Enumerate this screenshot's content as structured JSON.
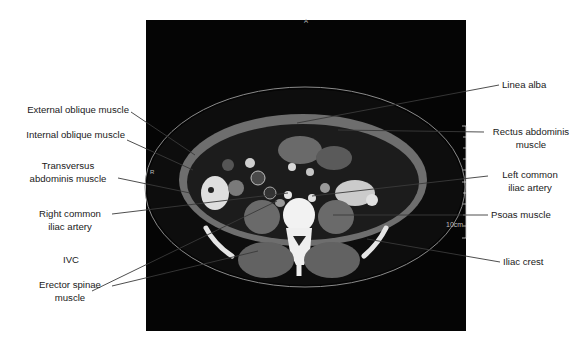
{
  "figure": {
    "type": "axial CT slice, lower abdomen",
    "orientation_marks": {
      "anterior": "A",
      "right": "R"
    },
    "scale_label": "10cm"
  },
  "labels": {
    "left": [
      {
        "id": "external-oblique",
        "lines": [
          "External oblique muscle"
        ]
      },
      {
        "id": "internal-oblique",
        "lines": [
          "Internal oblique muscle"
        ]
      },
      {
        "id": "transversus",
        "lines": [
          "Transversus",
          "abdominis muscle"
        ]
      },
      {
        "id": "right-common-iliac",
        "lines": [
          "Right common",
          "iliac artery"
        ]
      },
      {
        "id": "ivc",
        "lines": [
          "IVC"
        ]
      },
      {
        "id": "erector-spinae",
        "lines": [
          "Erector spinae",
          "muscle"
        ]
      }
    ],
    "right": [
      {
        "id": "linea-alba",
        "lines": [
          "Linea alba"
        ]
      },
      {
        "id": "rectus-abdominis",
        "lines": [
          "Rectus abdominis",
          "muscle"
        ]
      },
      {
        "id": "left-common-iliac",
        "lines": [
          "Left common",
          "iliac artery"
        ]
      },
      {
        "id": "psoas",
        "lines": [
          "Psoas muscle"
        ]
      },
      {
        "id": "iliac-crest",
        "lines": [
          "Iliac crest"
        ]
      }
    ]
  },
  "colors": {
    "background": "#ffffff",
    "scan_background": "#050505",
    "leader_line": "#3a3a3a",
    "label_text": "#1a1a1a"
  }
}
